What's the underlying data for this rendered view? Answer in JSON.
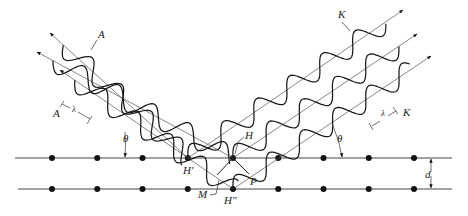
{
  "figure": {
    "incident_label": "A",
    "diffracted_label": "K",
    "wavelength_symbol": "λ",
    "angle_symbol": "θ",
    "spacing_symbol": "d",
    "points": {
      "h_prime": "H'",
      "h": "H",
      "h_double_prime": "H\"",
      "m": "M",
      "p": "P"
    },
    "incident_beam_count": 3,
    "diffracted_beam_count": 3,
    "atoms_per_plane": 9,
    "plane_count": 2,
    "colors": {
      "waves": "#1a1a1a",
      "rays": "#777777",
      "atoms": "#111111"
    }
  }
}
